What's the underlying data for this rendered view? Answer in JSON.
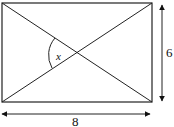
{
  "diagram": {
    "shape": "rectangle with both diagonals",
    "labels": {
      "width": "8",
      "height": "6",
      "angle": "x"
    },
    "colors": {
      "stroke": "#222222",
      "background": "#ffffff"
    }
  }
}
